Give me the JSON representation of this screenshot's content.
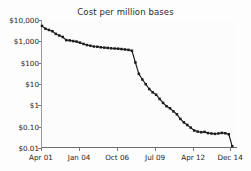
{
  "chart_data": {
    "type": "line",
    "title": "Cost per million bases",
    "xlabel": "",
    "ylabel": "",
    "yscale": "log",
    "ylim": [
      0.01,
      10000
    ],
    "grid": false,
    "legend": null,
    "ytick_labels": [
      "$10,000",
      "$1,000",
      "$100",
      "$10",
      "$1",
      "$0.10",
      "$0.01"
    ],
    "ytick_values": [
      10000,
      1000,
      100,
      10,
      1,
      0.1,
      0.01
    ],
    "xtick_labels": [
      "Apr 01",
      "Jan 04",
      "Oct 06",
      "Jul 09",
      "Apr 12",
      "Dec 14"
    ],
    "xtick_values": [
      "2001-04",
      "2004-01",
      "2006-10",
      "2009-07",
      "2012-04",
      "2014-12"
    ],
    "xlim": [
      "2001-04",
      "2015-06"
    ],
    "marker": "square",
    "line_color": "#1c1c1c",
    "x": [
      "2001-04",
      "2001-07",
      "2001-10",
      "2002-01",
      "2002-04",
      "2002-07",
      "2002-10",
      "2003-01",
      "2003-04",
      "2003-07",
      "2003-10",
      "2004-01",
      "2004-04",
      "2004-07",
      "2004-10",
      "2005-01",
      "2005-04",
      "2005-07",
      "2005-10",
      "2006-01",
      "2006-04",
      "2006-07",
      "2006-10",
      "2007-01",
      "2007-04",
      "2007-07",
      "2007-10",
      "2008-01",
      "2008-04",
      "2008-07",
      "2008-10",
      "2009-01",
      "2009-04",
      "2009-07",
      "2009-10",
      "2010-01",
      "2010-04",
      "2010-07",
      "2010-10",
      "2011-01",
      "2011-04",
      "2011-07",
      "2011-10",
      "2012-01",
      "2012-04",
      "2012-07",
      "2012-10",
      "2013-01",
      "2013-04",
      "2013-07",
      "2013-10",
      "2014-01",
      "2014-04",
      "2014-07",
      "2014-10",
      "2015-01"
    ],
    "values": [
      5292.39,
      3898.64,
      3413.8,
      2986.2,
      2230.98,
      1871.65,
      1598.91,
      1135.7,
      1107.46,
      1028.5,
      974.16,
      866.08,
      755.42,
      669.65,
      623.32,
      571.67,
      556.75,
      526.62,
      505.1,
      490.99,
      471.3,
      460.66,
      452.08,
      433.89,
      415.73,
      397.09,
      363.05,
      102.13,
      29.92,
      16.3,
      9.78,
      5.81,
      4.08,
      3.14,
      1.99,
      1.3,
      0.91,
      0.73,
      0.52,
      0.38,
      0.23,
      0.16,
      0.12,
      0.09,
      0.066,
      0.059,
      0.055,
      0.057,
      0.05,
      0.048,
      0.046,
      0.048,
      0.051,
      0.049,
      0.044,
      0.012
    ]
  },
  "axes": {
    "y_labels": [
      {
        "text": "$10,000",
        "value": 10000
      },
      {
        "text": "$1,000",
        "value": 1000
      },
      {
        "text": "$100",
        "value": 100
      },
      {
        "text": "$10",
        "value": 10
      },
      {
        "text": "$1",
        "value": 1
      },
      {
        "text": "$0.10",
        "value": 0.1
      },
      {
        "text": "$0.01",
        "value": 0.01
      }
    ],
    "x_labels": [
      {
        "text": "Apr 01"
      },
      {
        "text": "Jan 04"
      },
      {
        "text": "Oct 06"
      },
      {
        "text": "Jul 09"
      },
      {
        "text": "Apr 12"
      },
      {
        "text": "Dec 14"
      }
    ]
  }
}
